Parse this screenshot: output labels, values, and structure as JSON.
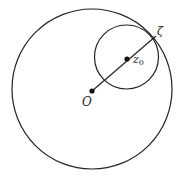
{
  "diagram": {
    "type": "geometry",
    "stroke_color": "#222222",
    "background": "#ffffff",
    "big_circle": {
      "cx": 92,
      "cy": 89,
      "r": 80
    },
    "small_circle": {
      "cx": 126.5,
      "cy": 57,
      "r": 32
    },
    "segment": {
      "x1": 92,
      "y1": 91,
      "x2": 156,
      "y2": 36
    },
    "points": [
      {
        "id": "O",
        "label": "O",
        "x": 92,
        "y": 91,
        "dot": true,
        "label_x": 82,
        "label_y": 106
      },
      {
        "id": "z0",
        "label": "z",
        "subscript": "0",
        "x": 127,
        "y": 59,
        "dot": true,
        "label_x": 133,
        "label_y": 63
      },
      {
        "id": "zeta",
        "label": "ζ",
        "x": 156,
        "y": 36,
        "dot": false,
        "label_x": 157,
        "label_y": 35
      }
    ]
  }
}
